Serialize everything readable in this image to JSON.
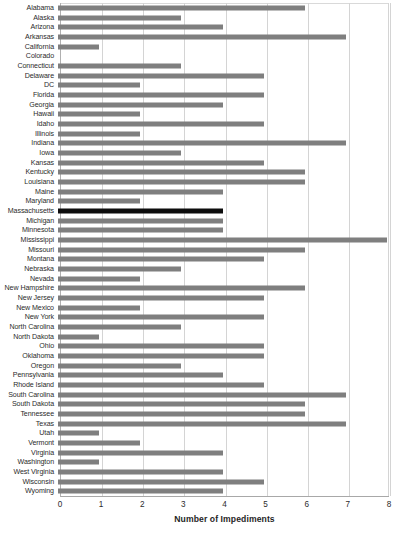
{
  "chart_data": {
    "type": "bar",
    "orientation": "horizontal",
    "title": "",
    "xlabel": "Number of Impediments",
    "ylabel": "",
    "xlim": [
      0,
      8
    ],
    "xticks": [
      0,
      1,
      2,
      3,
      4,
      5,
      6,
      7,
      8
    ],
    "grid": true,
    "legend": false,
    "bar_color": "#7f7f7f",
    "highlight_color": "#0d0d0d",
    "highlighted_category": "Massachusetts",
    "categories": [
      "Alabama",
      "Alaska",
      "Arizona",
      "Arkansas",
      "California",
      "Colorado",
      "Connecticut",
      "Delaware",
      "DC",
      "Florida",
      "Georgia",
      "Hawaii",
      "Idaho",
      "Illinois",
      "Indiana",
      "Iowa",
      "Kansas",
      "Kentucky",
      "Louisiana",
      "Maine",
      "Maryland",
      "Massachusetts",
      "Michigan",
      "Minnesota",
      "Mississippi",
      "Missouri",
      "Montana",
      "Nebraska",
      "Nevada",
      "New Hampshire",
      "New Jersey",
      "New Mexico",
      "New York",
      "North Carolina",
      "North Dakota",
      "Ohio",
      "Oklahoma",
      "Oregon",
      "Pennsylvania",
      "Rhode Island",
      "South Carolina",
      "South Dakota",
      "Tennessee",
      "Texas",
      "Utah",
      "Vermont",
      "Virginia",
      "Washington",
      "West Virginia",
      "Wisconsin",
      "Wyoming"
    ],
    "values": [
      6,
      3,
      4,
      7,
      1,
      0,
      3,
      5,
      2,
      5,
      4,
      2,
      5,
      2,
      7,
      3,
      5,
      6,
      6,
      4,
      2,
      4,
      4,
      4,
      8,
      6,
      5,
      3,
      2,
      6,
      5,
      2,
      5,
      3,
      1,
      5,
      5,
      3,
      4,
      5,
      7,
      6,
      6,
      7,
      1,
      2,
      4,
      1,
      4,
      5,
      4
    ]
  }
}
